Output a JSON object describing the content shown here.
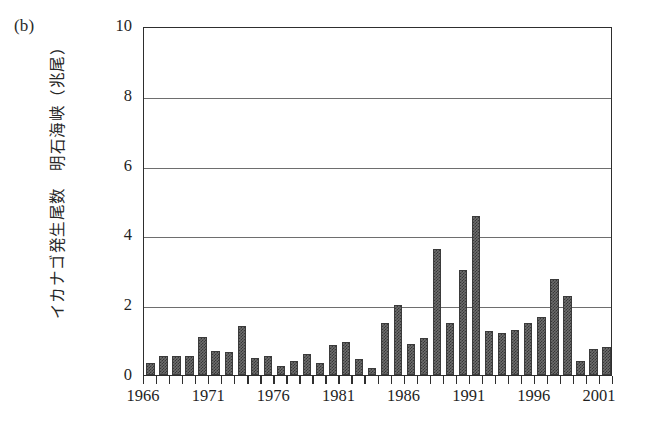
{
  "figure": {
    "panel_label": "(b)",
    "y_axis_title": "イカナゴ発生尾数　明石海峡（兆尾）"
  },
  "chart_data": {
    "type": "bar",
    "title": "",
    "subtitle": "",
    "panel": "(b)",
    "xlabel": "",
    "ylabel": "イカナゴ発生尾数　明石海峡（兆尾）",
    "ylabel_translation": "Number of sand lance larvae, Akashi Strait (trillion individuals)",
    "xlim": [
      1965,
      2001
    ],
    "ylim": [
      0,
      10
    ],
    "yticks": [
      0,
      2,
      4,
      6,
      8,
      10
    ],
    "ytick_labels": [
      "0",
      "2",
      "4",
      "6",
      "8",
      "10"
    ],
    "xticks": [
      1966,
      1971,
      1976,
      1981,
      1986,
      1991,
      1996,
      2001
    ],
    "xtick_labels": [
      "1966",
      "1971",
      "1976",
      "1981",
      "1986",
      "1991",
      "1996",
      "2001"
    ],
    "grid": "horizontal",
    "legend": "none",
    "bar_fill": "#6d6d6d",
    "bar_edge": "#3b3b3b",
    "axis_color": "#2e2e2e",
    "gridline_color": "#6e6e6e",
    "categories": [
      1966,
      1967,
      1968,
      1969,
      1970,
      1971,
      1972,
      1973,
      1974,
      1975,
      1976,
      1977,
      1978,
      1979,
      1980,
      1981,
      1982,
      1983,
      1984,
      1985,
      1986,
      1987,
      1988,
      1989,
      1990,
      1991,
      1992,
      1993,
      1994,
      1995,
      1996,
      1997,
      1998,
      1999,
      2000,
      2001
    ],
    "values": [
      0.35,
      0.55,
      0.55,
      0.55,
      1.1,
      0.7,
      0.65,
      1.4,
      0.5,
      0.55,
      0.25,
      0.4,
      0.6,
      0.35,
      0.85,
      0.95,
      0.45,
      0.2,
      1.5,
      2.0,
      0.9,
      1.05,
      3.6,
      1.5,
      3.0,
      4.55,
      1.25,
      1.2,
      1.3,
      1.5,
      1.65,
      2.75,
      2.25,
      0.4,
      0.75,
      0.8
    ]
  }
}
